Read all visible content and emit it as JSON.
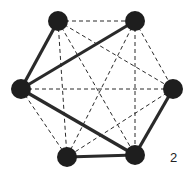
{
  "figure_label": "2",
  "colors": {
    "node": "#1e1e1e",
    "edge": "#2a2a2a",
    "background": "#ffffff"
  },
  "nodes": [
    {
      "id": "top-left",
      "x": 58,
      "y": 21
    },
    {
      "id": "top-right",
      "x": 135,
      "y": 21
    },
    {
      "id": "left",
      "x": 21,
      "y": 89
    },
    {
      "id": "right",
      "x": 173,
      "y": 89
    },
    {
      "id": "bottom-left",
      "x": 67,
      "y": 157
    },
    {
      "id": "bottom-right",
      "x": 135,
      "y": 155
    }
  ],
  "solid_edges": [
    [
      "top-left",
      "left"
    ],
    [
      "left",
      "top-right"
    ],
    [
      "left",
      "bottom-right"
    ],
    [
      "bottom-right",
      "right"
    ],
    [
      "bottom-left",
      "bottom-right"
    ]
  ],
  "dashed_edges": [
    [
      "top-left",
      "top-right"
    ],
    [
      "top-left",
      "right"
    ],
    [
      "top-left",
      "bottom-left"
    ],
    [
      "top-left",
      "bottom-right"
    ],
    [
      "top-right",
      "right"
    ],
    [
      "top-right",
      "bottom-left"
    ],
    [
      "top-right",
      "bottom-right"
    ],
    [
      "left",
      "right"
    ],
    [
      "left",
      "bottom-left"
    ],
    [
      "right",
      "bottom-left"
    ]
  ]
}
